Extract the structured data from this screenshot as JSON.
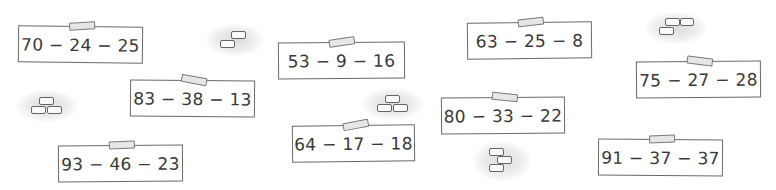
{
  "cards": [
    {
      "id": "c1",
      "expression": "70 − 24 − 25"
    },
    {
      "id": "c2",
      "expression": "83 − 38 − 13"
    },
    {
      "id": "c3",
      "expression": "93 − 46 − 23"
    },
    {
      "id": "c4",
      "expression": "53 − 9 − 16"
    },
    {
      "id": "c5",
      "expression": "64 − 17 − 18"
    },
    {
      "id": "c6",
      "expression": "63 − 25 − 8"
    },
    {
      "id": "c7",
      "expression": "80 − 33 − 22"
    },
    {
      "id": "c8",
      "expression": "75 − 27 − 28"
    },
    {
      "id": "c9",
      "expression": "91 − 37 − 37"
    }
  ],
  "decorations": [
    {
      "icon": "bricks-icon",
      "arrangement": "two-step"
    },
    {
      "icon": "bricks-icon",
      "arrangement": "pyramid"
    },
    {
      "icon": "bricks-icon",
      "arrangement": "pyramid"
    },
    {
      "icon": "bricks-icon",
      "arrangement": "zigzag-stack"
    },
    {
      "icon": "bricks-icon",
      "arrangement": "two-over-one"
    }
  ]
}
